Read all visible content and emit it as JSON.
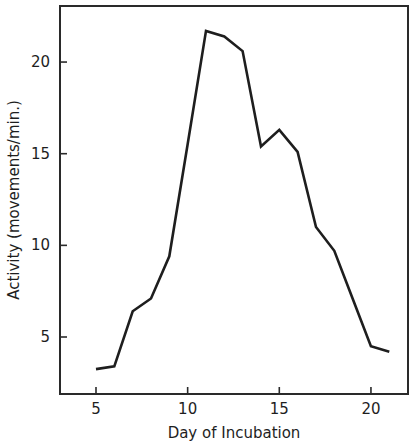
{
  "chart_data": {
    "type": "line",
    "title": "",
    "xlabel": "Day of Incubation",
    "ylabel": "Activity (movements/min.)",
    "xlim": [
      3,
      22
    ],
    "ylim": [
      2,
      23
    ],
    "x_ticks": [
      5,
      10,
      15,
      20
    ],
    "y_ticks": [
      5,
      10,
      15,
      20
    ],
    "grid": false,
    "legend": null,
    "series": [
      {
        "name": "Activity",
        "x": [
          5,
          6,
          7,
          8,
          9,
          10,
          11,
          12,
          13,
          14,
          15,
          16,
          17,
          18,
          19,
          20,
          21
        ],
        "values": [
          3.25,
          3.4,
          6.4,
          7.1,
          9.4,
          15.5,
          21.7,
          21.4,
          20.6,
          15.4,
          16.3,
          15.1,
          11.0,
          9.7,
          7.1,
          4.5,
          4.2
        ]
      }
    ],
    "colors": {
      "line": "#1e1e1e",
      "axis": "#2a2a2a",
      "background": "#ffffff"
    }
  }
}
